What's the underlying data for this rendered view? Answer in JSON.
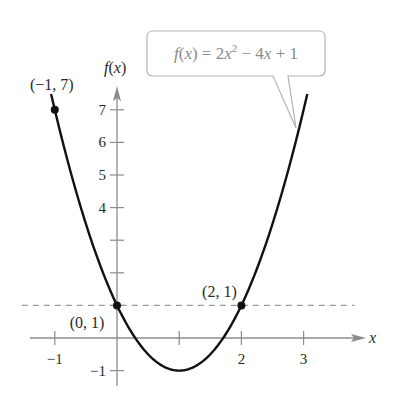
{
  "chart_data": {
    "type": "line",
    "title": "",
    "function_label": {
      "text_parts": [
        "f(x) = 2x",
        "2",
        " − 4x + 1"
      ],
      "expression": "f(x) = 2x^2 - 4x + 1"
    },
    "function": {
      "a": 2,
      "b": -4,
      "c": 1
    },
    "xlabel": "x",
    "ylabel": "f(x)",
    "xlim": [
      -1.4,
      3.9
    ],
    "ylim": [
      -1.3,
      7.8
    ],
    "curve_domain": [
      -1.06,
      3.06
    ],
    "x_ticks": [
      {
        "value": -1,
        "label": "−1"
      },
      {
        "value": 1,
        "label": ""
      },
      {
        "value": 2,
        "label": "2"
      },
      {
        "value": 3,
        "label": "3"
      }
    ],
    "y_ticks": [
      {
        "value": -1,
        "label": "−1"
      },
      {
        "value": 1,
        "label": ""
      },
      {
        "value": 2,
        "label": ""
      },
      {
        "value": 3,
        "label": ""
      },
      {
        "value": 4,
        "label": "4"
      },
      {
        "value": 5,
        "label": "5"
      },
      {
        "value": 6,
        "label": "6"
      },
      {
        "value": 7,
        "label": "7"
      }
    ],
    "points": [
      {
        "x": -1,
        "y": 7,
        "label": "(−1, 7)"
      },
      {
        "x": 0,
        "y": 1,
        "label": "(0, 1)"
      },
      {
        "x": 2,
        "y": 1,
        "label": "(2, 1)"
      }
    ],
    "reference_line": {
      "type": "horizontal",
      "y": 1,
      "style": "dashed",
      "x_range": [
        -1.53,
        3.82
      ]
    },
    "grid": false,
    "colors": {
      "curve": "#111111",
      "axis": "#8c8c8c",
      "dashed": "#9a9a9a",
      "callout_border": "#b5b5b5",
      "callout_text": "#8a8a8a"
    }
  }
}
